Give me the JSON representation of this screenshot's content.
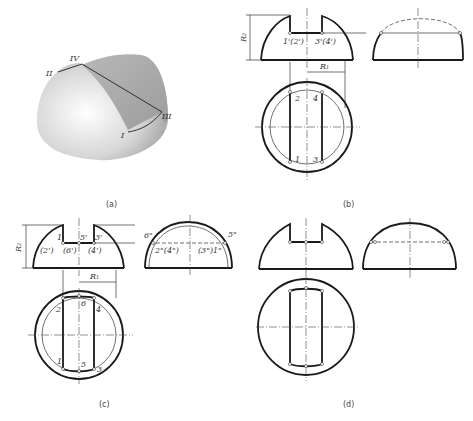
{
  "figure": {
    "panels": [
      {
        "id": "a",
        "caption": "(a)",
        "view": "3D pictorial of hemisphere with slot",
        "point_labels": [
          "II",
          "IV",
          "III",
          "I"
        ]
      },
      {
        "id": "b",
        "caption": "(b)",
        "front_labels": [
          "1'(2')",
          "3'(4')"
        ],
        "top_labels": [
          "2",
          "4",
          "1",
          "3"
        ],
        "dimensions": [
          "R2",
          "R1"
        ]
      },
      {
        "id": "c",
        "caption": "(c)",
        "front_labels": [
          "1'",
          "5'",
          "3'",
          "(2')",
          "(6')",
          "(4')"
        ],
        "side_labels": [
          "6\"",
          "5\"",
          "2\"(4\")",
          "(3\")1\""
        ],
        "top_labels": [
          "2",
          "6",
          "4",
          "1",
          "5",
          "3"
        ],
        "dimensions": [
          "R2",
          "R1"
        ]
      },
      {
        "id": "d",
        "caption": "(d)",
        "view": "final result"
      }
    ]
  },
  "labels": {
    "a_II": "II",
    "a_IV": "IV",
    "a_III": "III",
    "a_I": "I",
    "b_R2": "R",
    "b_R2_sub": "2",
    "b_R1": "R",
    "b_R1_sub": "1",
    "b_f12": "1'(2')",
    "b_f34": "3'(4')",
    "b_t2": "2",
    "b_t4": "4",
    "b_t1": "1",
    "b_t3": "3",
    "c_R2": "R",
    "c_R2_sub": "2",
    "c_R1": "R",
    "c_R1_sub": "1",
    "c_f1": "1'",
    "c_f5": "5'",
    "c_f3": "3'",
    "c_f2": "(2')",
    "c_f6": "(6')",
    "c_f4": "(4')",
    "c_s6": "6\"",
    "c_s5": "5\"",
    "c_s24": "2\"(4\")",
    "c_s31": "(3\")1\"",
    "c_t2": "2",
    "c_t6": "6",
    "c_t4": "4",
    "c_t1": "1",
    "c_t5": "5",
    "c_t3": "3",
    "cap_a": "(a)",
    "cap_b": "(b)",
    "cap_c": "(c)",
    "cap_d": "(d)"
  },
  "colors": {
    "line": "#1a1a1a",
    "sphere_light": "#f4f4f4",
    "sphere_dark": "#9a9a9a"
  }
}
